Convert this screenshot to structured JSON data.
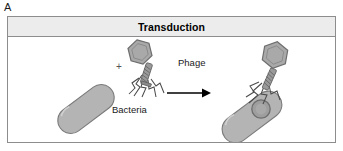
{
  "figure": {
    "panel_letter": "A",
    "title": "Transduction",
    "labels": {
      "bacteria": "Bacteria",
      "phage": "Phage",
      "plus": "+"
    },
    "colors": {
      "border": "#8d8d8d",
      "title_bar_bg": "#ececec",
      "title_text": "#000000",
      "panel_bg": "#ffffff",
      "bacteria_fill": "#b4b4b4",
      "bacteria_stroke": "#7a7a7a",
      "phage_head_fill": "#a9a9a9",
      "phage_head_stroke": "#6e6e6e",
      "phage_tail_fill": "#9a9a9a",
      "dna_circle_fill": "#9e9e9e",
      "dna_circle_stroke": "#6e6e6e",
      "arrow_color": "#000000",
      "leg_stroke": "#4a4a4a",
      "label_text": "#1a1a1a"
    },
    "elements": [
      "bacteria-cell",
      "plus-sign",
      "bacteriophage",
      "process-arrow",
      "infected-bacteria-cell",
      "transduced-dna-circle"
    ]
  }
}
